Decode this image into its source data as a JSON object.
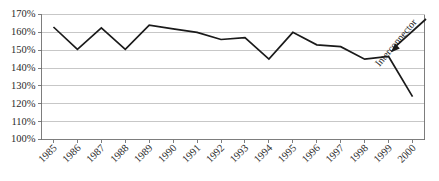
{
  "chart_data": {
    "type": "line",
    "title": "",
    "xlabel": "",
    "ylabel": "",
    "categories": [
      "1985",
      "1986",
      "1987",
      "1988",
      "1989",
      "1990",
      "1991",
      "1992",
      "1993",
      "1994",
      "1995",
      "1996",
      "1997",
      "1998",
      "1999",
      "2000"
    ],
    "values": [
      163,
      150.5,
      162.5,
      150.5,
      164,
      162,
      160,
      156,
      157,
      145,
      160,
      153,
      152,
      145,
      146.5,
      124
    ],
    "series": [
      {
        "name": "Reserve margin",
        "values": [
          163,
          150.5,
          162.5,
          150.5,
          164,
          162,
          160,
          156,
          157,
          145,
          160,
          153,
          152,
          145,
          146.5,
          124
        ]
      }
    ],
    "ylim": [
      100,
      170
    ],
    "ytick_labels": [
      "100%",
      "110%",
      "120%",
      "130%",
      "140%",
      "150%",
      "160%",
      "170%"
    ],
    "ytick_values": [
      100,
      110,
      120,
      130,
      140,
      150,
      160,
      170
    ],
    "grid": true,
    "legend": "none",
    "annotations": [
      {
        "text": "Interconnector",
        "points_to_category": "1999",
        "points_to_value": 146.5
      }
    ],
    "colors": {
      "series_line": "#1a1a1a",
      "gridline": "#b9b9b9",
      "axis": "#6f6f6f",
      "tick_text": "#2b2b2b",
      "background": "#ffffff"
    }
  }
}
